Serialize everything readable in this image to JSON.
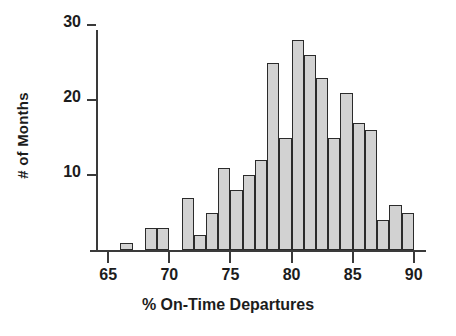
{
  "chart_data": {
    "type": "bar",
    "title": "",
    "subtitle": "",
    "xlabel": "% On-Time Departures",
    "ylabel": "# of Months",
    "bin_width": 1,
    "xlim": [
      64,
      91
    ],
    "ylim": [
      0,
      31
    ],
    "grid": false,
    "legend": null,
    "annotations": [],
    "x_ticks": [
      {
        "value": 65,
        "label": "65"
      },
      {
        "value": 70,
        "label": "70"
      },
      {
        "value": 75,
        "label": "75"
      },
      {
        "value": 80,
        "label": "80"
      },
      {
        "value": 85,
        "label": "85"
      },
      {
        "value": 90,
        "label": "90"
      }
    ],
    "y_ticks": [
      {
        "value": 10,
        "label": "10"
      },
      {
        "value": 20,
        "label": "20"
      },
      {
        "value": 30,
        "label": "30"
      }
    ],
    "categories": [
      "66-67",
      "68-69",
      "69-70",
      "71-72",
      "72-73",
      "73-74",
      "74-75",
      "75-76",
      "76-77",
      "77-78",
      "78-79",
      "79-80",
      "80-81",
      "81-82",
      "82-83",
      "83-84",
      "84-85",
      "85-86",
      "86-87",
      "87-88",
      "88-89",
      "89-90"
    ],
    "bin_starts": [
      66,
      68,
      69,
      71,
      72,
      73,
      74,
      75,
      76,
      77,
      78,
      79,
      80,
      81,
      82,
      83,
      84,
      85,
      86,
      87,
      88,
      89
    ],
    "values": [
      1,
      3,
      3,
      7,
      2,
      5,
      11,
      8,
      10,
      12,
      25,
      15,
      28,
      26,
      23,
      15,
      21,
      17,
      16,
      4,
      6,
      5
    ],
    "bar_fill_color": "#d2d2d2",
    "bar_edge_color": "#2b2b2b",
    "axis_color": "#3a3a3a"
  },
  "axes": {
    "x_title": "% On-Time Departures",
    "y_title": "# of Months"
  }
}
